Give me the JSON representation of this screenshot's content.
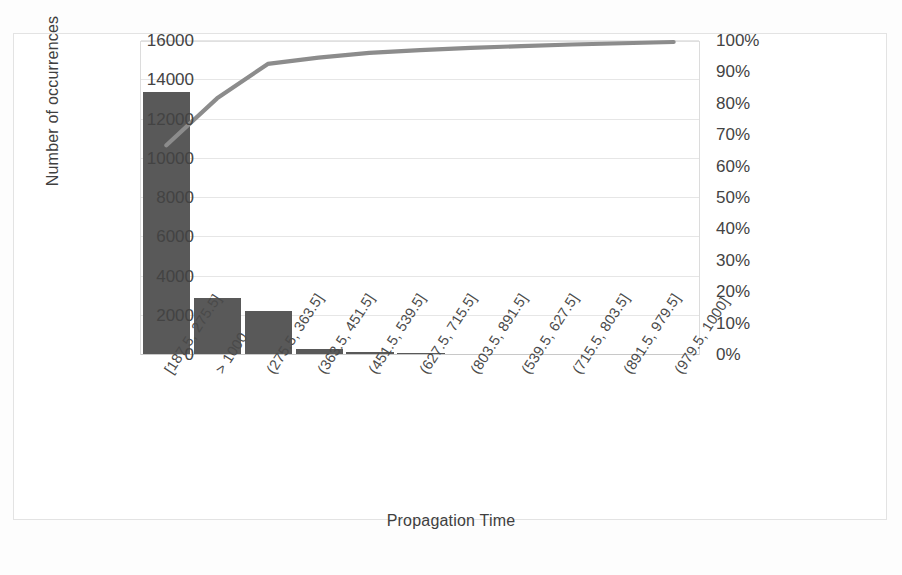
{
  "chart_data": {
    "type": "bar",
    "title": "",
    "subtitle": "",
    "xlabel": "Propagation Time",
    "ylabel": "Number of occurrences",
    "y2label": "",
    "grid": true,
    "legend": "none",
    "categories": [
      "[187.5, 275.5]",
      "> 1000",
      "(275.5, 363.5]",
      "(363.5, 451.5]",
      "(451.5, 539.5]",
      "(627.5, 715.5]",
      "(803.5, 891.5]",
      "(539.5, 627.5]",
      "(715.5, 803.5]",
      "(891.5, 979.5]",
      "(979.5, 1000]"
    ],
    "series": [
      {
        "name": "Number of occurrences",
        "type": "bar",
        "axis": "left",
        "color": "#595959",
        "values": [
          13400,
          2900,
          2250,
          330,
          170,
          95,
          60,
          45,
          30,
          25,
          15
        ]
      },
      {
        "name": "Cumulative percentage",
        "type": "line",
        "axis": "right",
        "color": "#8c8c8c",
        "values": [
          67,
          82,
          93,
          95,
          96.5,
          97.4,
          98.1,
          98.7,
          99.2,
          99.6,
          100
        ]
      }
    ],
    "ylim": [
      0,
      16000
    ],
    "y2lim": [
      0,
      100
    ],
    "yticks": [
      0,
      2000,
      4000,
      6000,
      8000,
      10000,
      12000,
      14000,
      16000
    ],
    "ytick_labels": [
      "0",
      "2000",
      "4000",
      "6000",
      "8000",
      "10000",
      "12000",
      "14000",
      "16000"
    ],
    "y2ticks": [
      0,
      10,
      20,
      30,
      40,
      50,
      60,
      70,
      80,
      90,
      100
    ],
    "y2tick_labels": [
      "0%",
      "10%",
      "20%",
      "30%",
      "40%",
      "50%",
      "60%",
      "70%",
      "80%",
      "90%",
      "100%"
    ]
  },
  "axes": {
    "y_title": "Number of occurrences",
    "x_title": "Propagation Time"
  },
  "colors": {
    "bar": "#595959",
    "line": "#8c8c8c",
    "grid": "#e6e6e6",
    "frame": "#e3e3e3",
    "text": "#3f3f3f",
    "background": "#ffffff"
  }
}
